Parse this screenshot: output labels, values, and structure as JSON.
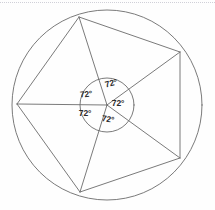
{
  "figure": {
    "name": "regular-pentagon-inscribed-in-circle",
    "background": "#fefefe",
    "stroke_color": "#6b6b6b",
    "stroke_width": 0.9,
    "label_color": "#2b2b2b",
    "top_rule_color": "#c9c9d2",
    "outer_circle": {
      "cx": 107,
      "cy": 105,
      "r": 95
    },
    "inner_circle": {
      "cx": 107,
      "cy": 105,
      "r": 27
    },
    "center_point": {
      "x": 107,
      "y": 105
    },
    "vertices": [
      {
        "name": "top",
        "x": 79,
        "y": 17,
        "angle_deg": -107
      },
      {
        "name": "upper-right",
        "x": 180,
        "y": 52,
        "angle_deg": -35
      },
      {
        "name": "lower-right",
        "x": 180,
        "y": 158,
        "angle_deg": 35
      },
      {
        "name": "bottom",
        "x": 80,
        "y": 192,
        "angle_deg": 107
      },
      {
        "name": "left",
        "x": 17,
        "y": 104,
        "angle_deg": 179
      }
    ],
    "angle_labels": [
      {
        "id": "angle-top",
        "text": "72°",
        "x": 111,
        "y": 83,
        "rotate": -14
      },
      {
        "id": "angle-upper-left",
        "text": "72°",
        "x": 86,
        "y": 94,
        "rotate": -6
      },
      {
        "id": "angle-right",
        "text": "72°",
        "x": 118,
        "y": 103,
        "rotate": 0
      },
      {
        "id": "angle-lower-left",
        "text": "72°",
        "x": 85,
        "y": 113,
        "rotate": 0
      },
      {
        "id": "angle-bottom",
        "text": "72°",
        "x": 108,
        "y": 119,
        "rotate": 8
      }
    ],
    "central_angle_value": "72°",
    "central_angle_count": 5
  }
}
